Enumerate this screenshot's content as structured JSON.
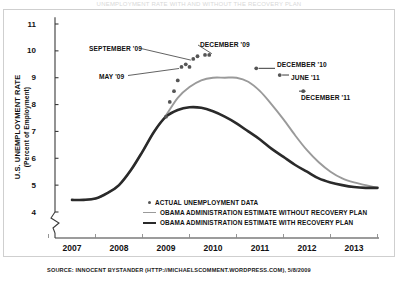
{
  "top_title_fragment": "UNEMPLOYMENT RATE WITH AND WITHOUT THE RECOVERY PLAN",
  "axes": {
    "y_title_main": "U.S. UNEMPLOYMENT RATE",
    "y_title_sub": "(Percent of Employment)",
    "y_ticks": [
      "11",
      "10",
      "9",
      "8",
      "7",
      "6",
      "5",
      "4"
    ],
    "x_ticks": [
      "2007",
      "2008",
      "2009",
      "2010",
      "2011",
      "2012",
      "2013"
    ]
  },
  "legend": {
    "items": [
      {
        "label": "ACTUAL UNEMPLOYMENT DATA",
        "marker": "dot",
        "color": "#555555"
      },
      {
        "label": "OBAMA ADMINISTRATION ESTIMATE WITHOUT RECOVERY PLAN",
        "marker": "line",
        "color": "#9a9a9a"
      },
      {
        "label": "OBAMA ADMINISTRATION ESTIMATE WITH RECOVERY PLAN",
        "marker": "line-dark",
        "color": "#2a2a2a"
      }
    ]
  },
  "annotations": [
    {
      "id": "september-09",
      "label": "SEPTEMBER '09"
    },
    {
      "id": "december-09",
      "label": "DECEMBER '09"
    },
    {
      "id": "may-09",
      "label": "MAY '09"
    },
    {
      "id": "december-10",
      "label": "DECEMBER '10"
    },
    {
      "id": "june-11",
      "label": "JUNE '11"
    },
    {
      "id": "december-11",
      "label": "DECEMBER '11"
    }
  ],
  "source": "SOURCE: INNOCENT BYSTANDER (HTTP://MICHAELSCOMMENT.WORDPRESS.COM), 5/8/2009",
  "chart_data": {
    "type": "line",
    "xlabel": "",
    "ylabel": "U.S. UNEMPLOYMENT RATE (Percent of Employment)",
    "xlim": [
      2006.5,
      2013.6
    ],
    "ylim": [
      3.9,
      11.2
    ],
    "y_axis_break_below": 4,
    "grid": false,
    "legend_position": "inside-bottom-center",
    "x": [
      2007.0,
      2007.25,
      2007.5,
      2007.75,
      2008.0,
      2008.25,
      2008.5,
      2008.75,
      2009.0,
      2009.25,
      2009.5,
      2009.75,
      2010.0,
      2010.25,
      2010.5,
      2010.75,
      2011.0,
      2011.25,
      2011.5,
      2011.75,
      2012.0,
      2012.25,
      2012.5,
      2012.75,
      2013.0,
      2013.25,
      2013.5
    ],
    "series": [
      {
        "name": "OBAMA ADMINISTRATION ESTIMATE WITHOUT RECOVERY PLAN",
        "color": "#9a9a9a",
        "values": [
          4.45,
          4.45,
          4.5,
          4.7,
          5.0,
          5.55,
          6.25,
          7.0,
          7.6,
          8.25,
          8.65,
          8.9,
          9.0,
          9.0,
          9.0,
          8.85,
          8.5,
          8.0,
          7.45,
          6.85,
          6.3,
          5.85,
          5.5,
          5.25,
          5.1,
          5.0,
          4.9
        ]
      },
      {
        "name": "OBAMA ADMINISTRATION ESTIMATE WITH RECOVERY PLAN",
        "color": "#2a2a2a",
        "values": [
          4.45,
          4.45,
          4.5,
          4.7,
          5.0,
          5.55,
          6.25,
          7.0,
          7.55,
          7.8,
          7.9,
          7.88,
          7.75,
          7.55,
          7.3,
          7.0,
          6.7,
          6.35,
          6.05,
          5.75,
          5.5,
          5.25,
          5.1,
          5.0,
          4.93,
          4.9,
          4.9
        ]
      }
    ],
    "scatter": {
      "name": "ACTUAL UNEMPLOYMENT DATA",
      "color": "#555555",
      "points": [
        {
          "x": 2009.0,
          "y": 7.55,
          "label": null
        },
        {
          "x": 2009.08,
          "y": 8.1,
          "label": null
        },
        {
          "x": 2009.17,
          "y": 8.5,
          "label": null
        },
        {
          "x": 2009.25,
          "y": 8.9,
          "label": null
        },
        {
          "x": 2009.33,
          "y": 9.4,
          "label": "MAY '09"
        },
        {
          "x": 2009.42,
          "y": 9.5,
          "label": null
        },
        {
          "x": 2009.5,
          "y": 9.4,
          "label": null
        },
        {
          "x": 2009.58,
          "y": 9.7,
          "label": "SEPTEMBER '09"
        },
        {
          "x": 2009.67,
          "y": 9.8,
          "label": null
        },
        {
          "x": 2009.83,
          "y": 9.85,
          "label": null
        },
        {
          "x": 2009.92,
          "y": 9.85,
          "label": "DECEMBER '09"
        },
        {
          "x": 2010.92,
          "y": 9.35,
          "label": "DECEMBER '10"
        },
        {
          "x": 2011.42,
          "y": 9.1,
          "label": "JUNE '11"
        },
        {
          "x": 2011.92,
          "y": 8.5,
          "label": "DECEMBER '11"
        }
      ]
    }
  }
}
